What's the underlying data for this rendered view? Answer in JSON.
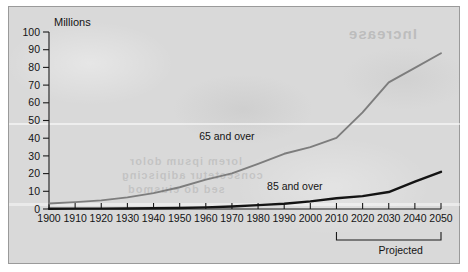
{
  "chart_data": {
    "type": "line",
    "title": "",
    "subtitle": "",
    "xlabel": "",
    "ylabel": "Millions",
    "ylim": [
      0,
      100
    ],
    "xlim": [
      1900,
      2050
    ],
    "grid": false,
    "legend_position": "inline-annotation",
    "x": [
      1900,
      1910,
      1920,
      1930,
      1940,
      1950,
      1960,
      1970,
      1980,
      1990,
      2000,
      2010,
      2020,
      2030,
      2040,
      2050
    ],
    "categories": [
      "1900",
      "1910",
      "1920",
      "1930",
      "1940",
      "1950",
      "1960",
      "1970",
      "1980",
      "1990",
      "2000",
      "2010",
      "2020",
      "2030",
      "2040",
      "2050"
    ],
    "xticks": [
      "1900",
      "1910",
      "1920",
      "1930",
      "1940",
      "1950",
      "1960",
      "1970",
      "1980",
      "1990",
      "2000",
      "2010",
      "2020",
      "2030",
      "2040",
      "2050"
    ],
    "yticks": [
      "0",
      "10",
      "20",
      "30",
      "40",
      "50",
      "60",
      "70",
      "80",
      "90",
      "100"
    ],
    "series": [
      {
        "name": "65 and over",
        "color": "#7d7d7d",
        "values": [
          3.1,
          3.9,
          4.9,
          6.6,
          9.0,
          12.3,
          16.6,
          20.1,
          25.5,
          31.2,
          35.0,
          40.2,
          54.6,
          71.5,
          79.7,
          88.0
        ],
        "label": "65 and over",
        "label_x": 1985,
        "label_y": 41
      },
      {
        "name": "85 and over",
        "color": "#141414",
        "values": [
          0.1,
          0.2,
          0.2,
          0.3,
          0.4,
          0.6,
          0.9,
          1.4,
          2.2,
          3.0,
          4.3,
          6.1,
          7.3,
          9.6,
          15.4,
          21.0
        ],
        "label": "85 and over",
        "label_x": 2011,
        "label_y": 13
      }
    ],
    "annotations": [
      {
        "name": "projected-bracket",
        "label": "Projected",
        "from_x": 2010,
        "to_x": 2050
      }
    ]
  },
  "axes": {
    "y_title": "Millions"
  },
  "bleed_text": {
    "heading": "Increase",
    "line1": "lorem ipsum dolor",
    "line2": "consectetur adipiscing",
    "line3": "sed do eiusmod"
  }
}
